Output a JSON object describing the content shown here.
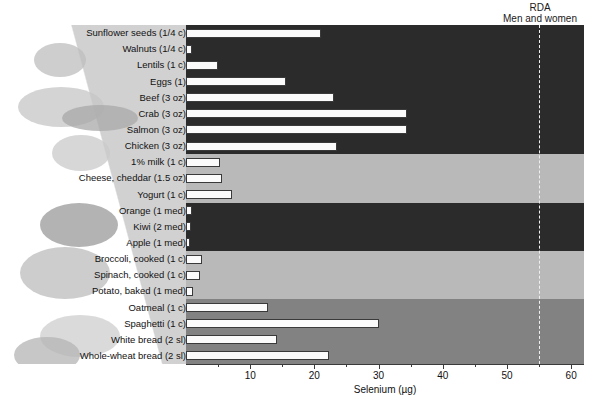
{
  "chart_data": {
    "type": "bar",
    "title": "",
    "xlabel": "Selenium (µg)",
    "ylabel": "",
    "xlim": [
      0,
      62
    ],
    "grid": false,
    "orientation": "horizontal",
    "tick_values": [
      10,
      20,
      30,
      40,
      50,
      60
    ],
    "tick_labels": [
      "10",
      "20",
      "30",
      "40",
      "50",
      "60"
    ],
    "reference_line": {
      "label_line1": "RDA",
      "label_line2": "Men and women",
      "value": 55,
      "style": "dashed"
    },
    "groups": [
      {
        "name": "Protein foods",
        "band_color": "#2b2b2b",
        "categories": [
          "Sunflower seeds (1/4 c)",
          "Walnuts (1/4 c)",
          "Lentils (1 c)",
          "Eggs (1)",
          "Beef (3 oz)",
          "Crab (3 oz)",
          "Salmon (3 oz)",
          "Chicken (3 oz)"
        ],
        "values": [
          21,
          1,
          5,
          15.5,
          23,
          34.5,
          34.5,
          23.5
        ]
      },
      {
        "name": "Dairy foods",
        "band_color": "#b9b9b9",
        "categories": [
          "1% milk (1 c)",
          "Cheese, cheddar (1.5 oz)",
          "Yogurt (1 c)"
        ],
        "values": [
          5.3,
          5.6,
          7.2
        ]
      },
      {
        "name": "Fruits",
        "band_color": "#2b2b2b",
        "categories": [
          "Orange (1 med)",
          "Kiwi (2 med)",
          "Apple (1 med)"
        ],
        "values": [
          0.9,
          0.8,
          0.7
        ]
      },
      {
        "name": "Vegetables",
        "band_color": "#b9b9b9",
        "categories": [
          "Broccoli, cooked (1 c)",
          "Spinach, cooked (1 c)",
          "Potato, baked (1 med)"
        ],
        "values": [
          2.5,
          2.2,
          1.1
        ]
      },
      {
        "name": "Grains",
        "band_color": "#828282",
        "categories": [
          "Oatmeal (1 c)",
          "Spaghetti (1 c)",
          "White bread (2 sl)",
          "Whole-wheat bread (2 sl)"
        ],
        "values": [
          12.8,
          30,
          14.2,
          22.3
        ]
      }
    ]
  },
  "axis": {
    "title": "Selenium (µg)",
    "ticks": [
      "10",
      "20",
      "30",
      "40",
      "50",
      "60"
    ]
  },
  "rda": {
    "line1": "RDA",
    "line2": "Men and women"
  },
  "labels": [
    "Sunflower seeds (1/4 c)",
    "Walnuts (1/4 c)",
    "Lentils (1 c)",
    "Eggs (1)",
    "Beef (3 oz)",
    "Crab (3 oz)",
    "Salmon (3 oz)",
    "Chicken (3 oz)",
    "1% milk (1 c)",
    "Cheese, cheddar (1.5 oz)",
    "Yogurt (1 c)",
    "Orange (1 med)",
    "Kiwi (2 med)",
    "Apple (1 med)",
    "Broccoli, cooked (1 c)",
    "Spinach, cooked (1 c)",
    "Potato, baked (1 med)",
    "Oatmeal (1 c)",
    "Spaghetti (1 c)",
    "White bread (2 sl)",
    "Whole-wheat bread (2 sl)"
  ],
  "colors": {
    "band_dark": "#2b2b2b",
    "band_light": "#b9b9b9",
    "band_mid": "#828282",
    "bar_fill": "#fbfbfb",
    "bar_stroke": "#3a3a3a",
    "text": "#111111"
  }
}
